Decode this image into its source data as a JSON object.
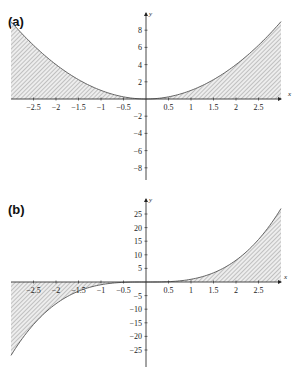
{
  "chart_data": [
    {
      "type": "area",
      "panel_label": "(a)",
      "title": "",
      "function": "y = x^2",
      "shaded_region": "between curve and x-axis, x in [-3, 3]",
      "xlabel": "x",
      "ylabel": "y",
      "xlim": [
        -3,
        3
      ],
      "ylim": [
        -9,
        9
      ],
      "x_ticks": [
        -2.5,
        -2,
        -1.5,
        -1,
        -0.5,
        0.5,
        1,
        1.5,
        2,
        2.5
      ],
      "x_tick_labels": [
        "-2.5",
        "-2",
        "-1.5",
        "-1",
        "-0.5",
        "0.5",
        "1",
        "1.5",
        "2",
        "2.5"
      ],
      "y_ticks": [
        8,
        6,
        4,
        2,
        -2,
        -4,
        -6,
        -8
      ],
      "y_tick_labels": [
        "8",
        "6",
        "4",
        "2",
        "-2",
        "-4",
        "-6",
        "-8"
      ],
      "x": [
        -3,
        -2.5,
        -2,
        -1.5,
        -1,
        -0.5,
        0,
        0.5,
        1,
        1.5,
        2,
        2.5,
        3
      ],
      "values": [
        9,
        6.25,
        4,
        2.25,
        1,
        0.25,
        0,
        0.25,
        1,
        2.25,
        4,
        6.25,
        9
      ],
      "grid": false,
      "legend": null
    },
    {
      "type": "area",
      "panel_label": "(b)",
      "title": "",
      "function": "y = x^3",
      "shaded_region": "between curve and x-axis, x in [-3, 3]",
      "xlabel": "x",
      "ylabel": "y",
      "xlim": [
        -3,
        3
      ],
      "ylim": [
        -30,
        30
      ],
      "x_ticks": [
        -2.5,
        -2,
        -1.5,
        -1,
        -0.5,
        0.5,
        1,
        1.5,
        2,
        2.5
      ],
      "x_tick_labels": [
        "-2.5",
        "-2",
        "-1.5",
        "-1",
        "-0.5",
        "0.5",
        "1",
        "1.5",
        "2",
        "2.5"
      ],
      "y_ticks": [
        25,
        20,
        15,
        10,
        5,
        -5,
        -10,
        -15,
        -20,
        -25
      ],
      "y_tick_labels": [
        "25",
        "20",
        "15",
        "10",
        "5",
        "-5",
        "-10",
        "-15",
        "-20",
        "-25"
      ],
      "x": [
        -3,
        -2.5,
        -2,
        -1.5,
        -1,
        -0.5,
        0,
        0.5,
        1,
        1.5,
        2,
        2.5,
        3
      ],
      "values": [
        -27,
        -15.625,
        -8,
        -3.375,
        -1,
        -0.125,
        0,
        0.125,
        1,
        3.375,
        8,
        15.625,
        27
      ],
      "grid": false,
      "legend": null
    }
  ],
  "panels": {
    "a": {
      "label": "(a)",
      "x_axis_name": "x",
      "y_axis_name": "y"
    },
    "b": {
      "label": "(b)",
      "x_axis_name": "x",
      "y_axis_name": "y"
    }
  },
  "colors": {
    "axis": "#333333",
    "curve": "#555555",
    "hatch": "#9a9a9a",
    "fill_bg": "#ececec"
  }
}
